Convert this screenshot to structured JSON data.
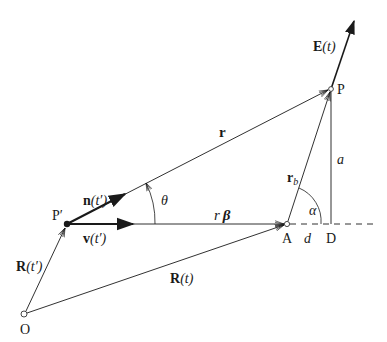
{
  "diagram": {
    "type": "vector-geometry",
    "colors": {
      "stroke": "#1a1a1a",
      "background": "#ffffff"
    },
    "points": {
      "O": {
        "label": "O",
        "x": 24,
        "y": 314
      },
      "P_prime": {
        "label": "P′",
        "x": 67,
        "y": 224
      },
      "A": {
        "label": "A",
        "x": 287,
        "y": 224
      },
      "P": {
        "label": "P",
        "x": 331,
        "y": 89
      },
      "D": {
        "label": "D",
        "x": 331,
        "y": 224
      }
    },
    "vectors": {
      "R_t_prime": {
        "label_main": "R",
        "label_arg": "(t′)"
      },
      "R_t": {
        "label_main": "R",
        "label_arg": "(t)"
      },
      "n_t_prime": {
        "label_main": "n",
        "label_arg": "(t′)"
      },
      "v_t_prime": {
        "label_main": "v",
        "label_arg": "(t′)"
      },
      "r": {
        "label_main": "r"
      },
      "r_beta": {
        "label_r": "r",
        "label_beta": "β"
      },
      "r_b": {
        "label_main": "r",
        "label_sub": "b"
      },
      "E_t": {
        "label_main": "E",
        "label_arg": "(t)"
      }
    },
    "segments": {
      "a": {
        "label": "a"
      },
      "d": {
        "label": "d"
      }
    },
    "angles": {
      "theta": {
        "label": "θ"
      },
      "alpha": {
        "label": "α"
      }
    }
  }
}
